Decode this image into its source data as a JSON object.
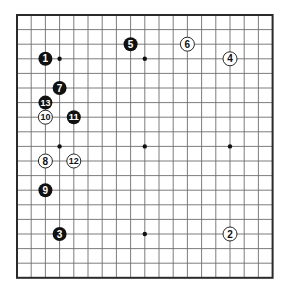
{
  "board": {
    "size": 19,
    "origin_x": 17,
    "origin_y": 15,
    "spacing_x": 14.2,
    "spacing_y": 14.6,
    "line_color": "#6e6e6e",
    "edge_color": "#2a2a2a",
    "background": "#ffffff",
    "star_points": [
      [
        3,
        3
      ],
      [
        9,
        3
      ],
      [
        15,
        3
      ],
      [
        3,
        9
      ],
      [
        9,
        9
      ],
      [
        15,
        9
      ],
      [
        3,
        15
      ],
      [
        9,
        15
      ],
      [
        15,
        15
      ]
    ]
  },
  "stones": [
    {
      "number": "1",
      "color": "black",
      "col": 2,
      "row": 3
    },
    {
      "number": "2",
      "color": "white",
      "col": 15,
      "row": 15
    },
    {
      "number": "3",
      "color": "black",
      "col": 3,
      "row": 15
    },
    {
      "number": "4",
      "color": "white",
      "col": 15,
      "row": 3
    },
    {
      "number": "5",
      "color": "black",
      "col": 8,
      "row": 2
    },
    {
      "number": "6",
      "color": "white",
      "col": 12,
      "row": 2
    },
    {
      "number": "7",
      "color": "black",
      "col": 3,
      "row": 5
    },
    {
      "number": "8",
      "color": "white",
      "col": 2,
      "row": 10
    },
    {
      "number": "9",
      "color": "black",
      "col": 2,
      "row": 12
    },
    {
      "number": "10",
      "color": "white",
      "col": 2,
      "row": 7
    },
    {
      "number": "11",
      "color": "black",
      "col": 4,
      "row": 7
    },
    {
      "number": "12",
      "color": "white",
      "col": 4,
      "row": 10
    },
    {
      "number": "13",
      "color": "black",
      "col": 2,
      "row": 6
    }
  ]
}
